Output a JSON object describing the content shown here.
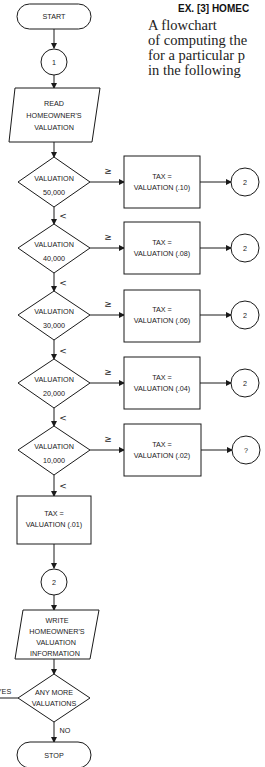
{
  "header": {
    "title": "EX. [3]  HOMEC"
  },
  "paragraph": {
    "lines": [
      "A flowchart",
      "of computing the",
      "for a particular p",
      "in the following"
    ]
  },
  "flowchart": {
    "start": "START",
    "connector_1": "1",
    "read": [
      "READ",
      "HOMEOWNER'S",
      "VALUATION"
    ],
    "decisions": [
      {
        "top": "VALUATION",
        "bottom": "50,000",
        "ge_label": "≥",
        "lt_label": "<",
        "tax": [
          "TAX =",
          "VALUATION (.10)"
        ],
        "connector": "2"
      },
      {
        "top": "VALUATION",
        "bottom": "40,000",
        "ge_label": "≥",
        "lt_label": "<",
        "tax": [
          "TAX =",
          "VALUATION (.08)"
        ],
        "connector": "2"
      },
      {
        "top": "VALUATION",
        "bottom": "30,000",
        "ge_label": "≥",
        "lt_label": "<",
        "tax": [
          "TAX =",
          "VALUATION (.06)"
        ],
        "connector": "2"
      },
      {
        "top": "VALUATION",
        "bottom": "20,000",
        "ge_label": "≥",
        "lt_label": "<",
        "tax": [
          "TAX =",
          "VALUATION (.04)"
        ],
        "connector": "2"
      },
      {
        "top": "VALUATION",
        "bottom": "10,000",
        "ge_label": "≥",
        "lt_label": "<",
        "tax": [
          "TAX =",
          "VALUATION (.02)"
        ],
        "connector": "?"
      }
    ],
    "default_tax": [
      "TAX =",
      "VALUATION (.01)"
    ],
    "connector_2": "2",
    "write": [
      "WRITE",
      "HOMEOWNER'S",
      "VALUATION",
      "INFORMATION"
    ],
    "loop_decision": [
      "ANY MORE",
      "VALUATIONS"
    ],
    "yes_label": "YES",
    "no_label": "NO",
    "stop": "STOP"
  }
}
